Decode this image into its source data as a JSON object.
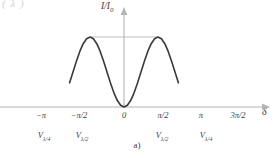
{
  "figure": {
    "caption": "a)",
    "top_fragment": "( λ        )",
    "axes": {
      "y_label_main": "I/I",
      "y_label_sub": "0",
      "x_label": "δ"
    }
  },
  "chart_data": {
    "type": "line",
    "title": "",
    "subtitle": "",
    "xlabel": "δ",
    "ylabel": "I/I0",
    "grid": false,
    "legend": false,
    "xlim": [
      -3.6651914,
      5.2359878
    ],
    "ylim": [
      0,
      1.12
    ],
    "x_ticks": [
      -3.1415927,
      -1.5707963,
      0,
      1.5707963,
      4.712389
    ],
    "x_ticklabels": [
      "−π",
      "−π/2",
      "0",
      "π/2",
      "π",
      "3π/2"
    ],
    "x_ticklabels_full": [
      "−π",
      "−π/2",
      "0",
      "π/2",
      "π",
      "3π/2"
    ],
    "x_tick_values": [
      -3.1415927,
      -1.5707963,
      0.0,
      1.5707963,
      3.1415927,
      4.712389
    ],
    "secondary_labels": [
      {
        "x": -3.1415927,
        "text_main": "V",
        "text_sub": "λ/4"
      },
      {
        "x": -1.5707963,
        "text_main": "V",
        "text_sub": "λ/2"
      },
      {
        "x": 1.5707963,
        "text_main": "V",
        "text_sub": "λ/2"
      },
      {
        "x": 3.1415927,
        "text_main": "V",
        "text_sub": "λ/4"
      }
    ],
    "series": [
      {
        "name": "I/I0",
        "formula": "sin^2(delta)  (minimum 0 at delta=0, maxima 1 at delta=+/-pi/2)",
        "color": "#3a3a3a",
        "linewidth": 1.6,
        "x": [
          -2.5132741,
          -2.3561945,
          -2.1991149,
          -2.0420352,
          -1.8849556,
          -1.727876,
          -1.5707963,
          -1.4137167,
          -1.2566371,
          -1.0995574,
          -0.9424778,
          -0.7853982,
          -0.6283185,
          -0.4712389,
          -0.3141593,
          -0.1570796,
          0.0,
          0.1570796,
          0.3141593,
          0.4712389,
          0.6283185,
          0.7853982,
          0.9424778,
          1.0995574,
          1.2566371,
          1.4137167,
          1.5707963,
          1.727876,
          1.8849556,
          2.0420352,
          2.1991149,
          2.3561945,
          2.5132741
        ],
        "y": [
          0.3455,
          0.5,
          0.6545,
          0.7939,
          0.9045,
          0.9755,
          1.0,
          0.9755,
          0.9045,
          0.7939,
          0.6545,
          0.5,
          0.3455,
          0.2061,
          0.0955,
          0.0245,
          0.0,
          0.0245,
          0.0955,
          0.2061,
          0.3455,
          0.5,
          0.6545,
          0.7939,
          0.9045,
          0.9755,
          1.0,
          0.9755,
          0.9045,
          0.7939,
          0.6545,
          0.5,
          0.3455
        ]
      }
    ],
    "reference_line": {
      "type": "horizontal",
      "y": 1.0,
      "x_start": -1.5707963,
      "x_end": 1.5707963,
      "color": "#aeaeae",
      "linewidth": 0.8
    },
    "axis_color": "#b4b4b4",
    "curve_color": "#3a3a3a"
  }
}
